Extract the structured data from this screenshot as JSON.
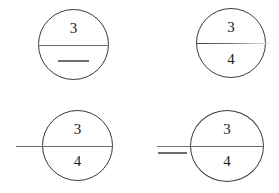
{
  "figure": {
    "background_color": "#ffffff",
    "stroke_color": "#3a3a3a",
    "text_color": "#1d1d1d"
  },
  "panels": [
    {
      "id": "panel-top-left",
      "position": "top-left",
      "numerator": "3",
      "denominator": "",
      "has_inner_dash": true,
      "fraction_bar": "full-diameter",
      "external_bar": "none",
      "description": "Circle with numeral 3 above diameter line and a short dash below"
    },
    {
      "id": "panel-top-right",
      "position": "top-right",
      "numerator": "3",
      "denominator": "4",
      "has_inner_dash": false,
      "fraction_bar": "full-diameter-fading-right",
      "external_bar": "none",
      "description": "Circle with fraction 3 over 4, dividing line fades toward the right"
    },
    {
      "id": "panel-bottom-left",
      "position": "bottom-left",
      "numerator": "3",
      "denominator": "4",
      "has_inner_dash": false,
      "fraction_bar": "full-diameter",
      "external_bar": "extends-left-continuous",
      "description": "Circle with fraction 3 over 4 and line extending out to the left"
    },
    {
      "id": "panel-bottom-right",
      "position": "bottom-right",
      "numerator": "3",
      "denominator": "4",
      "has_inner_dash": false,
      "fraction_bar": "full-diameter",
      "external_bar": "detached-dash-left",
      "description": "Circle with fraction 3 over 4 and a separate minus-like dash to the left"
    }
  ]
}
